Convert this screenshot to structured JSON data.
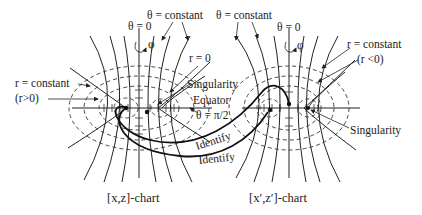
{
  "figure": {
    "left_chart": {
      "caption": "[x,z]-chart",
      "labels": {
        "theta_zero": "θ = 0",
        "theta_constant": "θ = constant",
        "phi": "φ",
        "r_zero": "r = 0",
        "r_constant": "r = constant",
        "r_positive": "(r>0)"
      }
    },
    "right_chart": {
      "caption": "[x′,z′]-chart",
      "labels": {
        "theta_zero": "θ = 0",
        "theta_constant": "θ = constant",
        "phi": "φ",
        "r_constant": "r = constant",
        "r_negative": "(r <0)",
        "singularity": "Singularity"
      }
    },
    "center_labels": {
      "singularity": "Singularity",
      "equator": "Equator",
      "theta_pi_half": "θ = π/2",
      "identify_upper": "Identify",
      "identify_lower": "Identify"
    },
    "colors": {
      "ink": "#222222",
      "background": "#ffffff"
    }
  }
}
